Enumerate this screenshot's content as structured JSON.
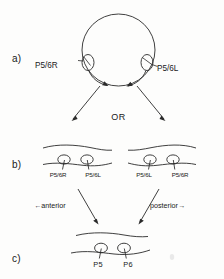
{
  "figure": {
    "type": "diagram",
    "title": "",
    "background_color": "#fdfdfc",
    "ink_color": "#2a2a2a",
    "panels": [
      {
        "id": "a",
        "label": "a)",
        "description": "top-down head outline with two lateral electrodes",
        "electrodes": [
          {
            "name": "P5/6R",
            "side": "left"
          },
          {
            "name": "P5/6L",
            "side": "right"
          }
        ]
      },
      {
        "id": "b",
        "label": "b)",
        "description": "two alternative flattened montage orientations",
        "connector": "OR",
        "left_montage": {
          "electrodes": [
            "P5/6R",
            "P5/6L"
          ]
        },
        "right_montage": {
          "electrodes": [
            "P5/6L",
            "P5/6R"
          ]
        },
        "direction_left": "anterior",
        "direction_right": "posterior",
        "direction_left_arrow": "←",
        "direction_right_arrow": "→"
      },
      {
        "id": "c",
        "label": "c)",
        "description": "resolved montage with final channel names",
        "electrodes": [
          "P5",
          "P6"
        ]
      }
    ]
  }
}
